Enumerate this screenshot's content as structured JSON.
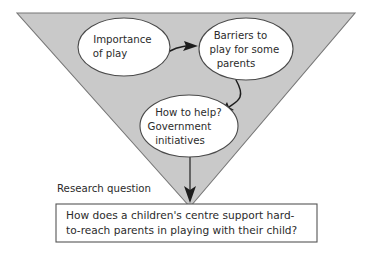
{
  "diagram": {
    "title_label": "Research question",
    "funnel": {
      "shape": "inverted-triangle",
      "fill_color": "#c9c9c9",
      "stroke_color": "#6e6e6e"
    },
    "bubbles": [
      {
        "id": "importance-of-play",
        "lines": [
          "Importance",
          "of play"
        ]
      },
      {
        "id": "barriers-to-play",
        "lines": [
          "Barriers to",
          "play for some",
          "parents"
        ]
      },
      {
        "id": "how-to-help",
        "lines": [
          "How to help?",
          "Government",
          "initiatives"
        ]
      }
    ],
    "research_question": {
      "lines": [
        "How does a children's centre support hard-",
        "to-reach parents in playing with their child?"
      ]
    }
  }
}
